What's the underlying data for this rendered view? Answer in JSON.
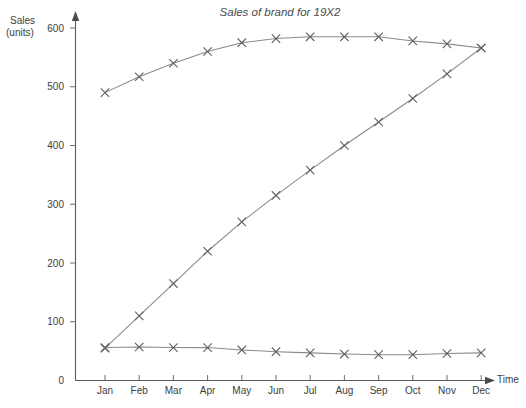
{
  "chart_data": {
    "type": "line",
    "title": "Sales of brand for 19X2",
    "xlabel": "Time",
    "ylabel": "Sales (units)",
    "categories": [
      "Jan",
      "Feb",
      "Mar",
      "Apr",
      "May",
      "Jun",
      "Jul",
      "Aug",
      "Sep",
      "Oct",
      "Nov",
      "Dec"
    ],
    "ylim": [
      0,
      600
    ],
    "yticks": [
      0,
      100,
      200,
      300,
      400,
      500,
      600
    ],
    "ytick_labels": [
      "0",
      "100",
      "200",
      "300",
      "400",
      "500",
      "600"
    ],
    "grid": false,
    "legend": "none",
    "marker": "x",
    "line_color": "#8a8a8a",
    "marker_color": "#5f5f5f",
    "axis_color": "#5a5a5a",
    "series": [
      {
        "name": "upper-curve",
        "values": [
          490,
          517,
          540,
          560,
          575,
          582,
          585,
          585,
          585,
          578,
          573,
          566
        ]
      },
      {
        "name": "rising-line",
        "values": [
          55,
          110,
          165,
          220,
          270,
          315,
          358,
          400,
          440,
          480,
          522,
          566
        ]
      },
      {
        "name": "lower-flat-line",
        "values": [
          56,
          57,
          56,
          56,
          52,
          49,
          47,
          45,
          44,
          44,
          46,
          47
        ]
      }
    ]
  },
  "axis_labels": {
    "y_line1": "Sales",
    "y_line2": "(units)",
    "x_name": "Time"
  }
}
